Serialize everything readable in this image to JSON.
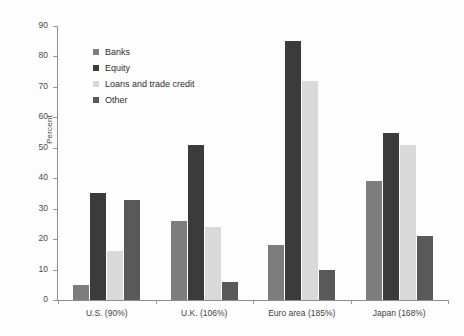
{
  "chart_data": {
    "type": "bar",
    "title": "",
    "subtitle": "",
    "xlabel": "",
    "ylabel": "Percent",
    "ylim": [
      0,
      90
    ],
    "ytick_step": 10,
    "yticks": [
      0,
      10,
      20,
      30,
      40,
      50,
      60,
      70,
      80,
      90
    ],
    "grid": false,
    "legend_position": "upper-left-inside",
    "categories": [
      "U.S. (90%)",
      "U.K. (106%)",
      "Euro area (185%)",
      "Japan (168%)"
    ],
    "series": [
      {
        "name": "Banks",
        "color": "#7d7d7d",
        "values": [
          5,
          26,
          18,
          39
        ]
      },
      {
        "name": "Equity",
        "color": "#3b3b3b",
        "values": [
          35,
          51,
          85,
          55
        ]
      },
      {
        "name": "Loans and trade credit",
        "color": "#d9d9d9",
        "values": [
          16,
          24,
          72,
          51
        ]
      },
      {
        "name": "Other",
        "color": "#595959",
        "values": [
          33,
          6,
          10,
          21
        ]
      }
    ]
  },
  "legend": {
    "items": [
      {
        "label": "Banks",
        "color": "#7d7d7d"
      },
      {
        "label": "Equity",
        "color": "#3b3b3b"
      },
      {
        "label": "Loans and trade credit",
        "color": "#d9d9d9"
      },
      {
        "label": "Other",
        "color": "#595959"
      }
    ]
  },
  "axes": {
    "y_title": "Percent"
  }
}
